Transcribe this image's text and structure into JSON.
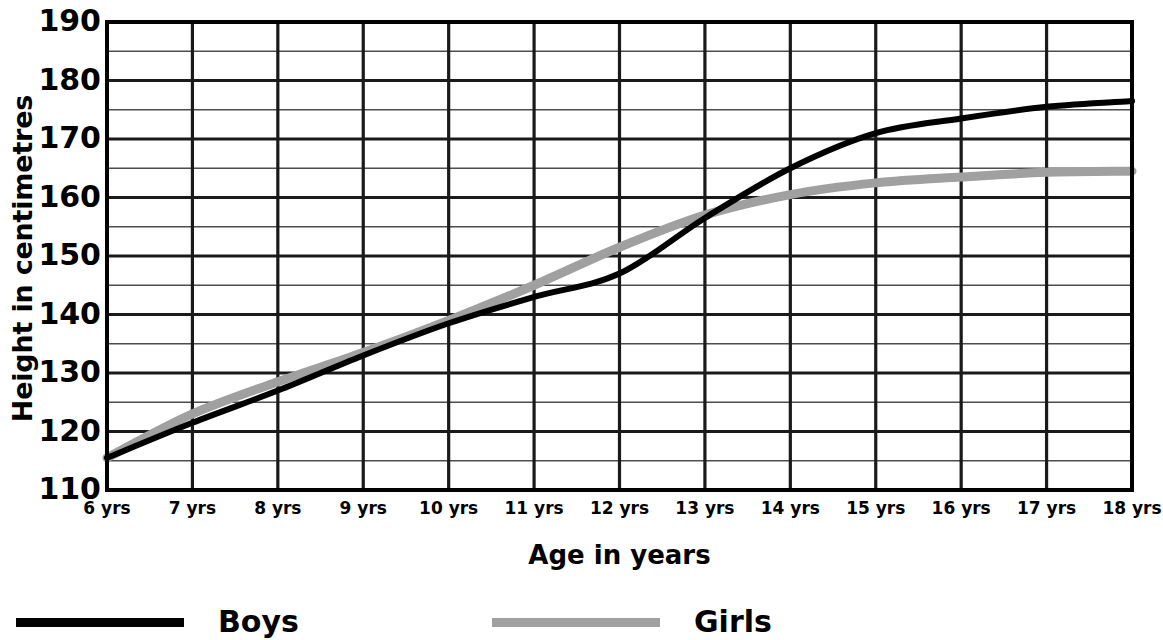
{
  "chart_data": {
    "type": "line",
    "title": "",
    "xlabel": "Age in years",
    "ylabel": "Height in centimetres",
    "xlim": [
      6,
      18
    ],
    "ylim": [
      110,
      190
    ],
    "y_tick_step": 10,
    "y_minor_step": 5,
    "grid": true,
    "legend_position": "bottom",
    "x": [
      6,
      7,
      8,
      9,
      10,
      11,
      12,
      13,
      14,
      15,
      16,
      17,
      18
    ],
    "x_tick_labels": [
      "6 yrs",
      "7 yrs",
      "8 yrs",
      "9 yrs",
      "10 yrs",
      "11 yrs",
      "12 yrs",
      "13 yrs",
      "14 yrs",
      "15 yrs",
      "16 yrs",
      "17 yrs",
      "18 yrs"
    ],
    "y_tick_labels": [
      "190",
      "180",
      "170",
      "160",
      "150",
      "140",
      "130",
      "120",
      "110"
    ],
    "y_tick_values": [
      190,
      180,
      170,
      160,
      150,
      140,
      130,
      120,
      110
    ],
    "series": [
      {
        "name": "Boys",
        "color": "#000000",
        "width": 6,
        "values": [
          115.5,
          121.5,
          127.0,
          133.0,
          138.5,
          143.0,
          147.0,
          156.5,
          165.0,
          171.0,
          173.5,
          175.5,
          176.5
        ]
      },
      {
        "name": "Girls",
        "color": "#a0a0a0",
        "width": 9,
        "values": [
          115.5,
          123.0,
          128.5,
          133.5,
          139.0,
          145.0,
          151.5,
          157.0,
          160.5,
          162.5,
          163.5,
          164.3,
          164.5
        ]
      }
    ]
  },
  "legend": {
    "items": [
      {
        "label": "Boys",
        "color": "#000000",
        "thickness": 9
      },
      {
        "label": "Girls",
        "color": "#a0a0a0",
        "thickness": 9
      }
    ]
  },
  "axes": {
    "y_title": "Height in centimetres",
    "x_title": "Age in years"
  },
  "colors": {
    "boys_line": "#000000",
    "girls_line": "#a0a0a0",
    "major_grid": "#1a1a1a",
    "minor_grid": "#4d4d4d",
    "frame": "#000000",
    "background": "#ffffff"
  }
}
